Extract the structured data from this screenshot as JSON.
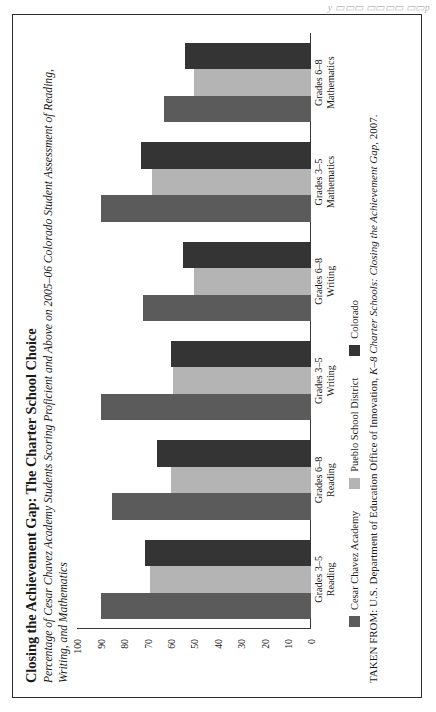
{
  "page": {
    "ghost_text": "y         ▭▭▭  ▭▭▭▭ ▭▭p"
  },
  "figure": {
    "title": "Closing the Achievement Gap: The Charter School Choice",
    "subtitle": "Percentage of Cesar Chavez Academy Students Scoring Proficient and Above on 2005–06 Colorado  Student Assessment of Reading, Writing, and Mathematics",
    "source_prefix": "TAKEN FROM: U.S. Department of Education Office of Innovation, ",
    "source_italic": "K–8 Charter Schools: Closing the Achievement Gap",
    "source_suffix": ", 2007."
  },
  "chart_data": {
    "type": "bar",
    "orientation": "vertical",
    "title": "Closing the Achievement Gap: The Charter School Choice",
    "subtitle": "Percentage of Cesar Chavez Academy Students Scoring Proficient and Above on 2005–06 Colorado  Student Assessment of Reading, Writing, and Mathematics",
    "xlabel": "",
    "ylabel": "",
    "ylim": [
      0,
      100
    ],
    "yticks": [
      0,
      10,
      20,
      30,
      40,
      50,
      60,
      70,
      80,
      90,
      100
    ],
    "grid": false,
    "legend_position": "bottom-left",
    "categories": [
      {
        "line1": "Grades 3–5",
        "line2": "Reading"
      },
      {
        "line1": "Grades 6–8",
        "line2": "Reading"
      },
      {
        "line1": "Grades 3–5",
        "line2": "Writing"
      },
      {
        "line1": "Grades 6–8",
        "line2": "Writing"
      },
      {
        "line1": "Grades 3–5",
        "line2": "Mathematics"
      },
      {
        "line1": "Grades 6–8",
        "line2": "Mathematics"
      }
    ],
    "category_labels": [
      "Grades 3–5 Reading",
      "Grades 6–8 Reading",
      "Grades 3–5 Writing",
      "Grades 6–8 Writing",
      "Grades 3–5 Mathematics",
      "Grades 6–8 Mathematics"
    ],
    "series": [
      {
        "name": "Cesar Chavez Academy",
        "color": "#5b5b5b",
        "values": [
          90,
          85,
          90,
          72,
          90,
          63
        ]
      },
      {
        "name": "Pueblo School District",
        "color": "#b4b4b4",
        "values": [
          69,
          60,
          59,
          50,
          68,
          50
        ]
      },
      {
        "name": "Colorado",
        "color": "#343434",
        "values": [
          71,
          66,
          60,
          55,
          73,
          54
        ]
      }
    ]
  }
}
